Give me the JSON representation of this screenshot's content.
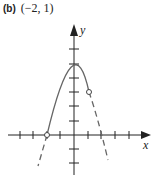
{
  "header": {
    "part_label": "(b)",
    "interval": "(−2, 1)"
  },
  "graph": {
    "x_axis_label": "x",
    "y_axis_label": "y",
    "function": "y = 4 - x^2",
    "solid_domain": [
      -2,
      1
    ],
    "open_points": [
      [
        -2,
        0
      ],
      [
        1,
        3
      ]
    ],
    "vertex": [
      0,
      4
    ],
    "x_ticks": [
      -4,
      -3,
      -2,
      -1,
      1,
      2,
      3,
      4
    ],
    "y_ticks": [
      -2,
      -1,
      1,
      2,
      3,
      4,
      5,
      6
    ],
    "colors": {
      "curve": "#666666",
      "axes": "#222222"
    }
  }
}
